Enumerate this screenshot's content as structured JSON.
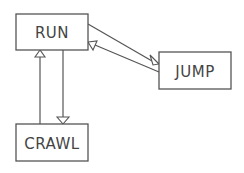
{
  "diagram": {
    "type": "state-diagram",
    "nodes": [
      {
        "id": "run",
        "label": "RUN"
      },
      {
        "id": "jump",
        "label": "JUMP"
      },
      {
        "id": "crawl",
        "label": "CRAWL"
      }
    ],
    "edges": [
      {
        "from": "run",
        "to": "jump"
      },
      {
        "from": "jump",
        "to": "run"
      },
      {
        "from": "run",
        "to": "crawl"
      },
      {
        "from": "crawl",
        "to": "run"
      }
    ],
    "colors": {
      "stroke": "#555555",
      "text": "#444444",
      "background": "#ffffff"
    }
  }
}
